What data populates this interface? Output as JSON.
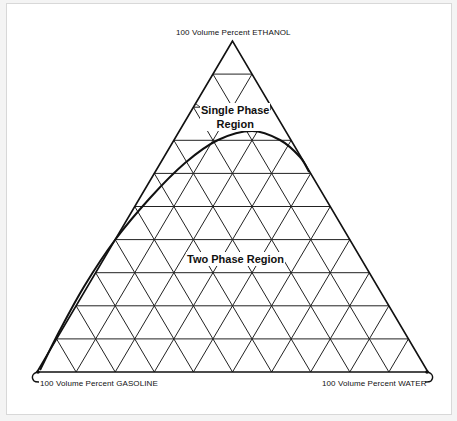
{
  "diagram": {
    "type": "ternary",
    "divisions": 10,
    "vertices": {
      "top": {
        "label": "100 Volume Percent ETHANOL",
        "component": "ETHANOL"
      },
      "bottom_left": {
        "label": "100 Volume Percent GASOLINE",
        "component": "GASOLINE"
      },
      "bottom_right": {
        "label": "100 Volume Percent WATER",
        "component": "WATER"
      }
    },
    "regions": {
      "single_phase": {
        "line1": "Single Phase",
        "line2": "Region"
      },
      "two_phase": {
        "label": "Two Phase Region"
      }
    },
    "phase_boundary": {
      "description": "Curved solubility boundary from near 100% gasoline corner rising to a peak near top, ending on the ethanol-water edge",
      "points_px": [
        [
          40,
          370
        ],
        [
          60,
          330
        ],
        [
          85,
          285
        ],
        [
          115,
          240
        ],
        [
          150,
          198
        ],
        [
          185,
          163
        ],
        [
          218,
          140
        ],
        [
          252,
          131
        ],
        [
          280,
          140
        ],
        [
          300,
          157
        ],
        [
          309,
          172
        ]
      ]
    },
    "colors": {
      "line": "#111111",
      "background": "#ffffff",
      "frame": "#d8d8d8"
    }
  }
}
